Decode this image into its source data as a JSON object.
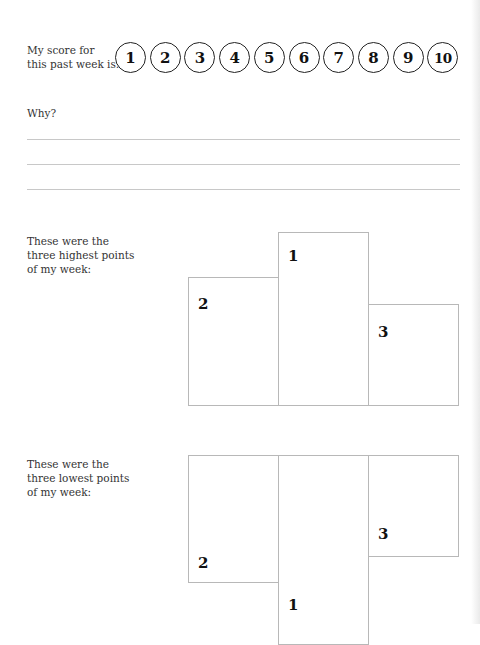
{
  "score": {
    "label": "My score for\nthis past week is:",
    "options": [
      "1",
      "2",
      "3",
      "4",
      "5",
      "6",
      "7",
      "8",
      "9",
      "10"
    ]
  },
  "why": {
    "label": "Why?",
    "lines": 3
  },
  "highest": {
    "label": "These were the\nthree highest points\nof my week:",
    "podium": [
      {
        "rank": "2"
      },
      {
        "rank": "1"
      },
      {
        "rank": "3"
      }
    ]
  },
  "lowest": {
    "label": "These were the\nthree lowest points\nof my week:",
    "podium": [
      {
        "rank": "2"
      },
      {
        "rank": "1"
      },
      {
        "rank": "3"
      }
    ]
  },
  "colors": {
    "text": "#2a2a2a",
    "circle_border": "#222222",
    "box_border": "#b8b8b8",
    "rule": "#c8c8c8"
  }
}
